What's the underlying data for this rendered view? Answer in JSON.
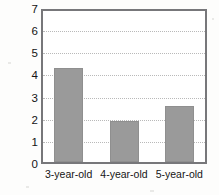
{
  "chart_data": {
    "type": "bar",
    "title": "",
    "xlabel": "",
    "ylabel": "Confidence in child",
    "categories": [
      "3-year-old",
      "4-year-old",
      "5-year-old"
    ],
    "values": [
      4.35,
      1.95,
      2.62
    ],
    "ylim": [
      0,
      7
    ],
    "ytick_labels": [
      "0",
      "1",
      "2",
      "3",
      "4",
      "5",
      "6",
      "7"
    ],
    "ytick_values": [
      0,
      1,
      2,
      3,
      4,
      5,
      6,
      7
    ],
    "grid": "horizontal-dotted",
    "gridline_values": [
      1,
      2,
      3,
      4,
      5,
      6
    ],
    "legend": "none",
    "bar_color": "#9a9a9a",
    "frame_color": "#77777a",
    "gridline_color": "#b9b9b9",
    "background_color": "#ffffff"
  }
}
